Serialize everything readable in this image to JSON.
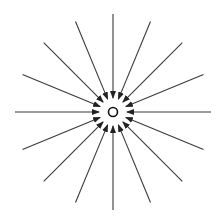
{
  "diagram": {
    "center": {
      "x": 113,
      "y": 112
    },
    "charge_circle_radius": 4.5,
    "line_count": 16,
    "outer_radius": 98,
    "arrow_tip_radius": 14,
    "colors": {
      "line": "#3a3a3a",
      "arrow": "#222222",
      "charge": "#111111",
      "background": "#ffffff"
    }
  }
}
